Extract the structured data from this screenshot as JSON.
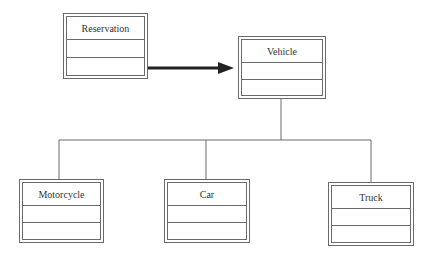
{
  "diagram": {
    "type": "uml-class-diagram",
    "classes": [
      {
        "id": "reservation",
        "name": "Reservation",
        "x": 63,
        "y": 13,
        "w": 85,
        "h": 66
      },
      {
        "id": "vehicle",
        "name": "Vehicle",
        "x": 238,
        "y": 36,
        "w": 88,
        "h": 63
      },
      {
        "id": "motorcycle",
        "name": "Motorcycle",
        "x": 19,
        "y": 179,
        "w": 85,
        "h": 64
      },
      {
        "id": "car",
        "name": "Car",
        "x": 164,
        "y": 179,
        "w": 86,
        "h": 64
      },
      {
        "id": "truck",
        "name": "Truck",
        "x": 328,
        "y": 182,
        "w": 86,
        "h": 64
      }
    ],
    "relationships": [
      {
        "type": "association",
        "from": "Reservation",
        "to": "Vehicle",
        "directed": true
      },
      {
        "type": "generalization",
        "from": "Motorcycle",
        "to": "Vehicle"
      },
      {
        "type": "generalization",
        "from": "Car",
        "to": "Vehicle"
      },
      {
        "type": "generalization",
        "from": "Truck",
        "to": "Vehicle"
      }
    ],
    "colors": {
      "line": "#6a6a6a",
      "arrow": "#222222",
      "text": "#333333"
    }
  }
}
